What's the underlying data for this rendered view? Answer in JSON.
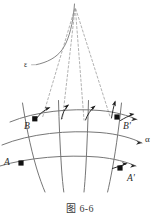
{
  "figure": {
    "caption": "图 6-6",
    "labels": {
      "point_B": "B",
      "point_B_prime": "B'",
      "point_A": "A",
      "point_A_prime": "A'",
      "surface_family": "α",
      "top_curve": "ε"
    },
    "colors": {
      "curve": "#6f6f6f",
      "dashed": "#8a8a8a",
      "marker": "#111111",
      "vector": "#222222",
      "label": "#2b2b2b",
      "caption": "#3a3a3a",
      "background": "#ffffff"
    },
    "points": [
      {
        "name": "B",
        "x": 35,
        "y": 119
      },
      {
        "name": "B'",
        "x": 117,
        "y": 117
      },
      {
        "name": "A",
        "x": 21,
        "y": 163
      },
      {
        "name": "A'",
        "x": 120,
        "y": 168
      }
    ],
    "vector_count": 6,
    "dashed_line_count": 4,
    "u_curve_count": 4,
    "v_curve_count": 3,
    "apex": {
      "x": 75,
      "y": 8
    }
  }
}
